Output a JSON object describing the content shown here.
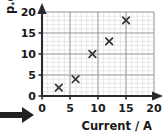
{
  "chart_data": {
    "type": "scatter",
    "title": "",
    "xlabel": "Current / A",
    "ylabel": "p.d. / V",
    "xlim": [
      0,
      20
    ],
    "ylim": [
      0,
      20
    ],
    "xticks": [
      "0",
      "5",
      "10",
      "15",
      "20"
    ],
    "yticks": [
      "0",
      "5",
      "10",
      "15",
      "20"
    ],
    "xtick_values": [
      0,
      5,
      10,
      15,
      20
    ],
    "ytick_values": [
      0,
      5,
      10,
      15,
      20
    ],
    "grid": "minor 1-unit light grid with major 5-unit grid",
    "legend": "none",
    "marker_style": "x",
    "x": [
      3,
      6,
      9,
      12,
      15
    ],
    "y": [
      2,
      4,
      10,
      13,
      18
    ],
    "points": [
      {
        "x": 3,
        "y": 2
      },
      {
        "x": 6,
        "y": 4
      },
      {
        "x": 9,
        "y": 10
      },
      {
        "x": 12,
        "y": 13
      },
      {
        "x": 15,
        "y": 18
      }
    ],
    "colors": {
      "marker": "#333333",
      "axis": "#2b2b2b",
      "grid_minor": "#c9c9cf",
      "grid_major": "#8e8e96",
      "background": "#ffffff"
    }
  },
  "annotations": {
    "pointer_arrow": "right-arrow-icon"
  }
}
